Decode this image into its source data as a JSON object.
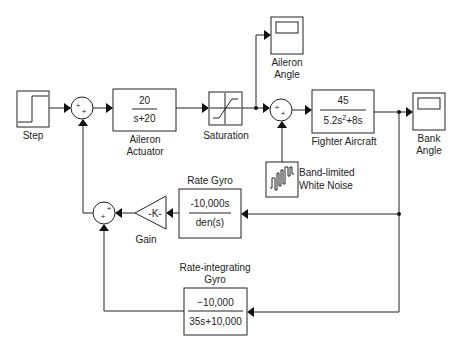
{
  "diagram": {
    "type": "simulink-block-diagram",
    "blocks": {
      "step": {
        "label": "Step"
      },
      "sum1": {
        "signs": [
          "+",
          "+"
        ]
      },
      "aileron_actuator": {
        "label_line1": "Aileron",
        "label_line2": "Actuator",
        "numerator": "20",
        "denominator": "s+20"
      },
      "saturation": {
        "label": "Saturation"
      },
      "aileron_angle": {
        "label_line1": "Aileron",
        "label_line2": "Angle"
      },
      "sum2": {
        "signs": [
          "+",
          "+"
        ]
      },
      "fighter_aircraft": {
        "label": "Fighter Aircraft",
        "numerator": "45",
        "denominator_base": "5.2s",
        "denominator_exp": "2",
        "denominator_rest": "+8s"
      },
      "bank_angle": {
        "label_line1": "Bank",
        "label_line2": "Angle"
      },
      "white_noise": {
        "label_line1": "Band-limited",
        "label_line2": "White Noise"
      },
      "rate_gyro": {
        "label": "Rate Gyro",
        "numerator": "-10,000s",
        "denominator": "den(s)"
      },
      "gain": {
        "label": "Gain",
        "value": "-K-"
      },
      "sum3": {
        "signs": [
          "+",
          "+"
        ]
      },
      "rate_integrating_gyro": {
        "label_line1": "Rate-integrating",
        "label_line2": "Gyro",
        "numerator": "−10,000",
        "denominator": "35s+10,000"
      }
    }
  }
}
